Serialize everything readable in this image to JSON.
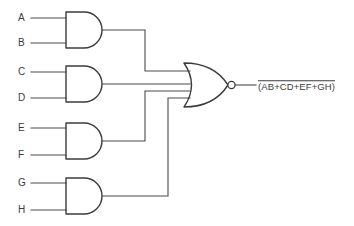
{
  "diagram": {
    "stroke_color": "#3c3c3c",
    "wire_color": "#4a4a4a",
    "background": "#ffffff"
  },
  "inputs": [
    {
      "label": "A",
      "gate": "and-gate-1",
      "pin": "top"
    },
    {
      "label": "B",
      "gate": "and-gate-1",
      "pin": "bottom"
    },
    {
      "label": "C",
      "gate": "and-gate-2",
      "pin": "top"
    },
    {
      "label": "D",
      "gate": "and-gate-2",
      "pin": "bottom"
    },
    {
      "label": "E",
      "gate": "and-gate-3",
      "pin": "top"
    },
    {
      "label": "F",
      "gate": "and-gate-3",
      "pin": "bottom"
    },
    {
      "label": "G",
      "gate": "and-gate-4",
      "pin": "top"
    },
    {
      "label": "H",
      "gate": "and-gate-4",
      "pin": "bottom"
    }
  ],
  "gates": [
    {
      "id": "and-gate-1",
      "type": "AND",
      "inputs": [
        "A",
        "B"
      ],
      "output_term": "AB"
    },
    {
      "id": "and-gate-2",
      "type": "AND",
      "inputs": [
        "C",
        "D"
      ],
      "output_term": "CD"
    },
    {
      "id": "and-gate-3",
      "type": "AND",
      "inputs": [
        "E",
        "F"
      ],
      "output_term": "EF"
    },
    {
      "id": "and-gate-4",
      "type": "AND",
      "inputs": [
        "G",
        "H"
      ],
      "output_term": "GH"
    },
    {
      "id": "nor-gate",
      "type": "NOR",
      "inputs": [
        "AB",
        "CD",
        "EF",
        "GH"
      ],
      "output_term": "(AB+CD+EF+GH)"
    }
  ],
  "output": {
    "expression": "(AB+CD+EF+GH)",
    "negated": true,
    "lead_dash": "—"
  }
}
